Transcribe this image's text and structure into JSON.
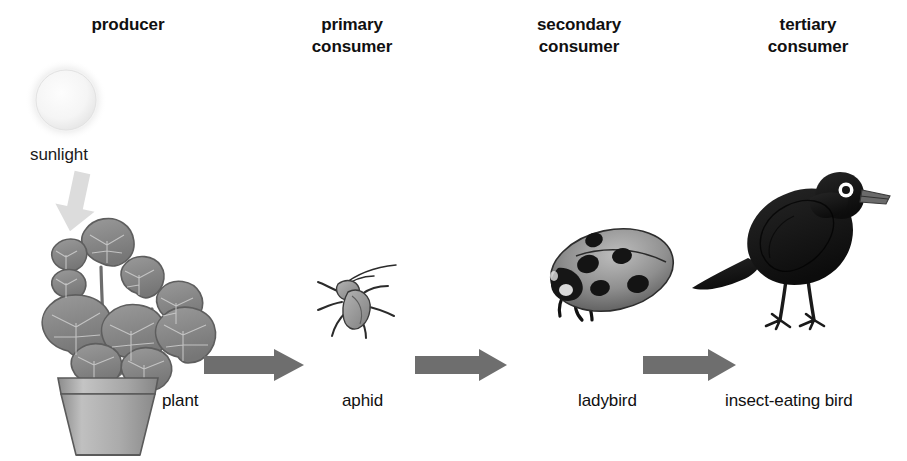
{
  "diagram": {
    "background_color": "#ffffff",
    "width": 907,
    "height": 461
  },
  "levels": [
    {
      "id": "producer",
      "label": "producer"
    },
    {
      "id": "primary-consumer",
      "label": "primary\nconsumer"
    },
    {
      "id": "secondary-consumer",
      "label": "secondary\nconsumer"
    },
    {
      "id": "tertiary-consumer",
      "label": "tertiary\nconsumer"
    }
  ],
  "organisms": [
    {
      "id": "plant",
      "label": "plant"
    },
    {
      "id": "aphid",
      "label": "aphid"
    },
    {
      "id": "ladybird",
      "label": "ladybird"
    },
    {
      "id": "bird",
      "label": "insect-eating bird"
    }
  ],
  "energy_source": {
    "id": "sunlight",
    "label": "sunlight",
    "icon": "sun-circle",
    "arrow_icon": "down-arrow"
  },
  "flow_arrows": [
    {
      "id": "arrow-plant-to-aphid",
      "icon": "right-arrow"
    },
    {
      "id": "arrow-aphid-to-ladybird",
      "icon": "right-arrow"
    },
    {
      "id": "arrow-ladybird-to-bird",
      "icon": "right-arrow"
    }
  ],
  "colors": {
    "text": "#101010",
    "arrow_gray": "#6e6e6e",
    "sun_fill": "#f4f4f4",
    "plant_leaf": "#8a8a8a",
    "pot_gray": "#a8a8a8",
    "insect_gray": "#9a9a9a",
    "ladybird_gray": "#8d8d8d",
    "bird_black": "#141414"
  }
}
